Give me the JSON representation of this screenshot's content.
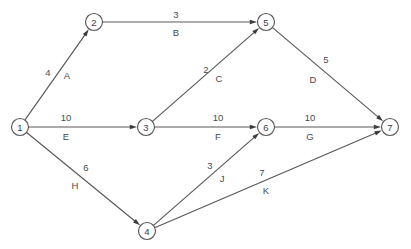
{
  "diagram": {
    "type": "activity-on-arrow-network",
    "title": "",
    "canvas": {
      "width": 411,
      "height": 249,
      "background": "#ffffff"
    },
    "style": {
      "line_color": "#58585a",
      "node_fill": "#ffffff",
      "node_stroke": "#58585a",
      "text_color": "#4a4a4c",
      "node_radius": 8.5
    },
    "nodes": [
      {
        "id": "n1",
        "label": "1",
        "x": 20,
        "y": 127
      },
      {
        "id": "n2",
        "label": "2",
        "x": 94,
        "y": 22
      },
      {
        "id": "n3",
        "label": "3",
        "x": 146,
        "y": 127
      },
      {
        "id": "n4",
        "label": "4",
        "x": 147,
        "y": 231
      },
      {
        "id": "n5",
        "label": "5",
        "x": 266,
        "y": 22
      },
      {
        "id": "n6",
        "label": "6",
        "x": 266,
        "y": 127
      },
      {
        "id": "n7",
        "label": "7",
        "x": 390,
        "y": 127
      }
    ],
    "edges": [
      {
        "id": "e-A",
        "activity": "A",
        "duration": "4",
        "from": "1",
        "to": "2",
        "from_x": 20,
        "from_y": 127,
        "to_x": 94,
        "to_y": 22,
        "dur_x": 48,
        "dur_y": 72,
        "act_x": 67,
        "act_y": 75
      },
      {
        "id": "e-B",
        "activity": "B",
        "duration": "3",
        "from": "2",
        "to": "5",
        "from_x": 94,
        "from_y": 22,
        "to_x": 266,
        "to_y": 22,
        "dur_x": 176,
        "dur_y": 14,
        "act_x": 176,
        "act_y": 32
      },
      {
        "id": "e-C",
        "activity": "C",
        "duration": "2",
        "from": "3",
        "to": "5",
        "from_x": 146,
        "from_y": 127,
        "to_x": 266,
        "to_y": 22,
        "dur_x": 206,
        "dur_y": 69,
        "act_x": 219,
        "act_y": 78
      },
      {
        "id": "e-D",
        "activity": "D",
        "duration": "5",
        "from": "5",
        "to": "7",
        "from_x": 266,
        "from_y": 22,
        "to_x": 390,
        "to_y": 127,
        "dur_x": 326,
        "dur_y": 59,
        "act_x": 313,
        "act_y": 79
      },
      {
        "id": "e-E",
        "activity": "E",
        "duration": "10",
        "from": "1",
        "to": "3",
        "from_x": 20,
        "from_y": 127,
        "to_x": 146,
        "to_y": 127,
        "dur_x": 66,
        "dur_y": 117,
        "act_x": 66,
        "act_y": 136
      },
      {
        "id": "e-F",
        "activity": "F",
        "duration": "10",
        "from": "3",
        "to": "6",
        "from_x": 146,
        "from_y": 127,
        "to_x": 266,
        "to_y": 127,
        "dur_x": 218,
        "dur_y": 117,
        "act_x": 218,
        "act_y": 136
      },
      {
        "id": "e-G",
        "activity": "G",
        "duration": "10",
        "from": "6",
        "to": "7",
        "from_x": 266,
        "from_y": 127,
        "to_x": 390,
        "to_y": 127,
        "dur_x": 310,
        "dur_y": 117,
        "act_x": 310,
        "act_y": 136
      },
      {
        "id": "e-H",
        "activity": "H",
        "duration": "6",
        "from": "1",
        "to": "4",
        "from_x": 20,
        "from_y": 127,
        "to_x": 147,
        "to_y": 231,
        "dur_x": 86,
        "dur_y": 167,
        "act_x": 75,
        "act_y": 185
      },
      {
        "id": "e-J",
        "activity": "J",
        "duration": "3",
        "from": "4",
        "to": "6",
        "from_x": 147,
        "from_y": 231,
        "to_x": 266,
        "to_y": 127,
        "dur_x": 210,
        "dur_y": 165,
        "act_x": 222,
        "act_y": 178
      },
      {
        "id": "e-K",
        "activity": "K",
        "duration": "7",
        "from": "4",
        "to": "7",
        "from_x": 147,
        "from_y": 231,
        "to_x": 390,
        "to_y": 127,
        "dur_x": 262,
        "dur_y": 172,
        "act_x": 266,
        "act_y": 190
      }
    ]
  }
}
